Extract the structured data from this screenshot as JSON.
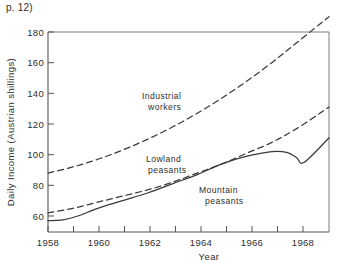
{
  "page_ref": "p. 12)",
  "chart_data": {
    "type": "line",
    "title": "",
    "xlabel": "Year",
    "ylabel": "Daily Income (Austrian shillings)",
    "xlim": [
      1958,
      1969.3
    ],
    "ylim": [
      52,
      192
    ],
    "xticks": [
      1958,
      1959,
      1960,
      1961,
      1962,
      1963,
      1964,
      1965,
      1966,
      1967,
      1968,
      1969
    ],
    "xticklabels": [
      "1958",
      "",
      "1960",
      "",
      "1962",
      "",
      "1964",
      "",
      "1966",
      "",
      "1968",
      ""
    ],
    "yticks": [
      60,
      80,
      100,
      120,
      140,
      160,
      180
    ],
    "yticklabels": [
      "60",
      "80",
      "100",
      "120",
      "140",
      "160",
      "180"
    ],
    "grid": false,
    "legend": "inline-annotations",
    "series": [
      {
        "name": "Industrial workers",
        "style": "dashed",
        "label_text_line1": "Industrial",
        "label_text_line2": "workers",
        "x": [
          1958,
          1959,
          1960,
          1961,
          1962,
          1963,
          1964,
          1965,
          1966,
          1967,
          1968,
          1969.3
        ],
        "values": [
          88,
          92,
          97,
          103,
          110,
          118,
          127,
          137,
          148,
          160,
          173,
          190
        ]
      },
      {
        "name": "Lowland peasants",
        "style": "dashed",
        "label_text_line1": "Lowland",
        "label_text_line2": "peasants",
        "x": [
          1958,
          1959,
          1960,
          1961,
          1962,
          1963,
          1964,
          1965,
          1966,
          1967,
          1968,
          1969.3
        ],
        "values": [
          62,
          65,
          69,
          73,
          77,
          82,
          88,
          94,
          101,
          108,
          117,
          131
        ]
      },
      {
        "name": "Mountain peasants",
        "style": "solid",
        "label_text_line1": "Mountain",
        "label_text_line2": "peasants",
        "x": [
          1958,
          1958.6,
          1959.2,
          1960,
          1961,
          1962,
          1963,
          1964,
          1965,
          1966,
          1967,
          1967.6,
          1968,
          1968.3,
          1969.3
        ],
        "values": [
          57,
          57.5,
          60,
          65,
          70,
          75,
          81,
          87,
          94,
          99,
          102,
          101.5,
          98,
          95,
          111
        ]
      }
    ],
    "annotations": [
      {
        "text": "Industrial workers",
        "x": 1961.6,
        "y": 133
      },
      {
        "text": "Lowland peasants",
        "x": 1961.8,
        "y": 102
      },
      {
        "text": "Mountain peasants",
        "x": 1964.0,
        "y": 85
      }
    ]
  }
}
